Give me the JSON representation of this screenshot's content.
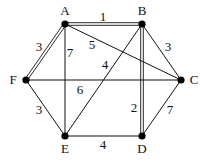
{
  "graph": {
    "nodes": [
      {
        "id": "A",
        "label": "A",
        "x": 65,
        "y": 24,
        "lx": 65,
        "ly": 15
      },
      {
        "id": "B",
        "label": "B",
        "x": 142,
        "y": 24,
        "lx": 142,
        "ly": 15
      },
      {
        "id": "C",
        "label": "C",
        "x": 181,
        "y": 80,
        "lx": 194,
        "ly": 84
      },
      {
        "id": "D",
        "label": "D",
        "x": 142,
        "y": 136,
        "lx": 142,
        "ly": 153
      },
      {
        "id": "E",
        "label": "E",
        "x": 65,
        "y": 136,
        "lx": 65,
        "ly": 153
      },
      {
        "id": "F",
        "label": "F",
        "x": 26,
        "y": 80,
        "lx": 13,
        "ly": 84
      }
    ],
    "edges": [
      {
        "from": "A",
        "to": "B",
        "weight": "1",
        "double": true,
        "lx": 103,
        "ly": 21
      },
      {
        "from": "A",
        "to": "F",
        "weight": "3",
        "double": true,
        "lx": 39,
        "ly": 51
      },
      {
        "from": "A",
        "to": "E",
        "weight": "7",
        "double": false,
        "lx": 70,
        "ly": 57
      },
      {
        "from": "A",
        "to": "C",
        "weight": "5",
        "double": false,
        "lx": 92,
        "ly": 49
      },
      {
        "from": "B",
        "to": "C",
        "weight": "3",
        "double": false,
        "lx": 168,
        "ly": 51
      },
      {
        "from": "B",
        "to": "E",
        "weight": "4",
        "double": false,
        "lx": 105,
        "ly": 69
      },
      {
        "from": "B",
        "to": "D",
        "weight": "2",
        "double": true,
        "lx": 134,
        "ly": 112
      },
      {
        "from": "F",
        "to": "C",
        "weight": "6",
        "double": false,
        "lx": 80,
        "ly": 94
      },
      {
        "from": "F",
        "to": "E",
        "weight": "3",
        "double": false,
        "lx": 39,
        "ly": 114
      },
      {
        "from": "E",
        "to": "D",
        "weight": "4",
        "double": false,
        "lx": 103,
        "ly": 149
      },
      {
        "from": "C",
        "to": "D",
        "weight": "7",
        "double": false,
        "lx": 170,
        "ly": 114
      }
    ]
  }
}
